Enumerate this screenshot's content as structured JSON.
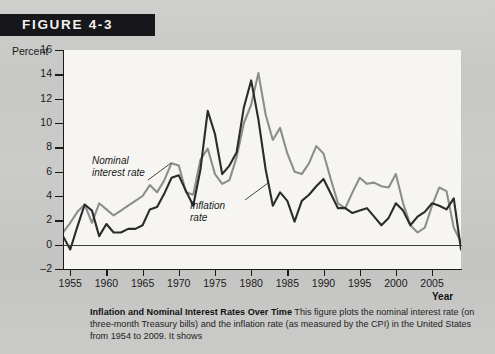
{
  "figure": {
    "header_label": "FIGURE 4-3"
  },
  "axes": {
    "y_title": "Percent",
    "x_title": "Year",
    "y_ticks": [
      "16",
      "14",
      "12",
      "10",
      "8",
      "6",
      "4",
      "2",
      "0",
      "–2"
    ],
    "x_ticks": [
      "1955",
      "1960",
      "1965",
      "1970",
      "1975",
      "1980",
      "1985",
      "1990",
      "1995",
      "2000",
      "2005"
    ]
  },
  "series_labels": {
    "nominal_line1": "Nominal",
    "nominal_line2": "interest rate",
    "inflation_line1": "Inflation",
    "inflation_line2": "rate"
  },
  "caption": {
    "title": "Inflation and Nominal Interest Rates Over Time",
    "body": "This figure plots the nominal interest rate (on three-month Treasury bills) and the inflation rate (as measured by the CPI) in the United States from 1954 to 2009. It shows"
  },
  "colors": {
    "header_bg": "#17161a",
    "header_text": "#f2f1ef",
    "page_bg": "#c9c9c7",
    "plot_bg": "#f6f5f2",
    "nominal": "#8d8d8d",
    "inflation": "#2b2b2b",
    "axis": "#1a1a1a"
  },
  "chart_data": {
    "type": "line",
    "title": "Inflation and Nominal Interest Rates Over Time",
    "xlabel": "Year",
    "ylabel": "Percent",
    "xlim": [
      1954,
      2009
    ],
    "ylim": [
      -2,
      16
    ],
    "grid": false,
    "legend": "inline-annotations",
    "x": [
      1954,
      1955,
      1956,
      1957,
      1958,
      1959,
      1960,
      1961,
      1962,
      1963,
      1964,
      1965,
      1966,
      1967,
      1968,
      1969,
      1970,
      1971,
      1972,
      1973,
      1974,
      1975,
      1976,
      1977,
      1978,
      1979,
      1980,
      1981,
      1982,
      1983,
      1984,
      1985,
      1986,
      1987,
      1988,
      1989,
      1990,
      1991,
      1992,
      1993,
      1994,
      1995,
      1996,
      1997,
      1998,
      1999,
      2000,
      2001,
      2002,
      2003,
      2004,
      2005,
      2006,
      2007,
      2008,
      2009
    ],
    "series": [
      {
        "name": "Nominal interest rate",
        "color": "#8d8d8d",
        "values": [
          1.0,
          1.8,
          2.7,
          3.3,
          1.8,
          3.4,
          2.9,
          2.4,
          2.8,
          3.2,
          3.6,
          4.0,
          4.9,
          4.3,
          5.3,
          6.7,
          6.5,
          4.3,
          4.1,
          7.0,
          7.9,
          5.8,
          5.0,
          5.3,
          7.2,
          10.0,
          11.5,
          14.1,
          10.7,
          8.6,
          9.6,
          7.5,
          6.0,
          5.8,
          6.7,
          8.1,
          7.5,
          5.4,
          3.4,
          3.0,
          4.3,
          5.5,
          5.0,
          5.1,
          4.8,
          4.7,
          5.8,
          3.4,
          1.6,
          1.0,
          1.4,
          3.2,
          4.7,
          4.4,
          1.4,
          0.2
        ]
      },
      {
        "name": "Inflation rate",
        "color": "#2b2b2b",
        "values": [
          0.7,
          -0.4,
          1.5,
          3.3,
          2.8,
          0.7,
          1.7,
          1.0,
          1.0,
          1.3,
          1.3,
          1.6,
          2.9,
          3.1,
          4.2,
          5.5,
          5.7,
          4.4,
          3.2,
          6.2,
          11.0,
          9.1,
          5.8,
          6.5,
          7.6,
          11.3,
          13.5,
          10.3,
          6.2,
          3.2,
          4.3,
          3.6,
          1.9,
          3.6,
          4.1,
          4.8,
          5.4,
          4.2,
          3.0,
          3.0,
          2.6,
          2.8,
          3.0,
          2.3,
          1.6,
          2.2,
          3.4,
          2.8,
          1.6,
          2.3,
          2.7,
          3.4,
          3.2,
          2.9,
          3.8,
          -0.4
        ]
      }
    ]
  }
}
